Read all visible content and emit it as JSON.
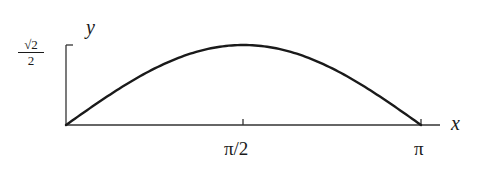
{
  "chart_data": {
    "type": "line",
    "title": "",
    "xlabel": "x",
    "ylabel": "y",
    "function": "(sqrt(2)/2) * sin(x)",
    "xlim": [
      0,
      3.14159
    ],
    "ylim": [
      0,
      0.7071
    ],
    "x_ticks": [
      {
        "value": 1.5708,
        "label": "π/2"
      },
      {
        "value": 3.14159,
        "label": "π"
      }
    ],
    "y_ticks": [
      {
        "value": 0.7071,
        "label": "√2/2",
        "numerator": "√2",
        "denominator": "2"
      }
    ],
    "x": [
      0,
      0.3927,
      0.7854,
      1.1781,
      1.5708,
      1.9635,
      2.3562,
      2.7489,
      3.14159
    ],
    "series": [
      {
        "name": "curve",
        "values": [
          0,
          0.2706,
          0.5,
          0.6533,
          0.7071,
          0.6533,
          0.5,
          0.2706,
          0
        ]
      }
    ],
    "grid": false,
    "legend": "none",
    "colors": {
      "axis": "#333333",
      "curve": "#1a1a1a"
    }
  },
  "labels": {
    "x_axis": "x",
    "y_axis": "y",
    "tick_half_pi": "π/2",
    "tick_pi": "π",
    "y_tick_num": "√2",
    "y_tick_den": "2"
  }
}
